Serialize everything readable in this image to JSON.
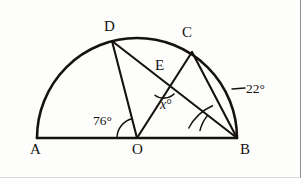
{
  "figure": {
    "type": "semicircle-geometry-diagram",
    "stroke_color": "#15120f",
    "background_color": "#fdfdfc"
  },
  "points": {
    "A": {
      "label": "A",
      "x": 37,
      "y": 138
    },
    "B": {
      "label": "B",
      "x": 237,
      "y": 138
    },
    "C": {
      "label": "C",
      "x": 192,
      "y": 52
    },
    "D": {
      "label": "D",
      "x": 112,
      "y": 41
    },
    "E": {
      "label": "E",
      "x": 166,
      "y": 86
    },
    "O": {
      "label": "O",
      "x": 137,
      "y": 138
    }
  },
  "circle": {
    "center_x": 137,
    "center_y": 138,
    "radius": 100
  },
  "angles": [
    {
      "name": "angle-AOD",
      "value": "76",
      "unit": "°",
      "text": "76°",
      "at_vertex": "O"
    },
    {
      "name": "angle-DEC",
      "value": "x",
      "unit": "°",
      "text": "x",
      "suffix": "°",
      "at_vertex": "E"
    },
    {
      "name": "angle-CBD",
      "value": "22",
      "unit": "°",
      "text": "22°",
      "at_vertex": "B"
    }
  ],
  "segments": [
    {
      "name": "diameter-AB",
      "from": "A",
      "to": "B"
    },
    {
      "name": "radius-OD",
      "from": "O",
      "to": "D"
    },
    {
      "name": "radius-OC",
      "from": "O",
      "to": "C"
    },
    {
      "name": "chord-DB",
      "from": "D",
      "to": "B"
    },
    {
      "name": "chord-CB",
      "from": "C",
      "to": "B"
    }
  ]
}
